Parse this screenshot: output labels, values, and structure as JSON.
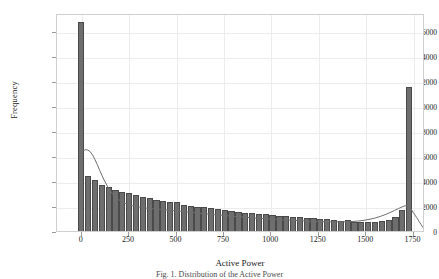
{
  "chart_data": {
    "type": "bar",
    "title": "",
    "xlabel": "Active Power",
    "ylabel": "Frequency",
    "xlim": [
      -130,
      1810
    ],
    "ylim": [
      0,
      17400
    ],
    "grid": true,
    "legend": null,
    "xticks": [
      0,
      250,
      500,
      750,
      1000,
      1250,
      1500,
      1750
    ],
    "yticks": [
      0,
      2000,
      4000,
      6000,
      8000,
      10000,
      12000,
      14000,
      16000
    ],
    "bar_color": "#6e6e6e",
    "bar_edge_color": "#4a4a4a",
    "kde_color": "#6e6e6e",
    "bin_width": 36,
    "x": [
      0,
      36,
      72,
      108,
      144,
      180,
      216,
      252,
      288,
      324,
      360,
      396,
      432,
      468,
      504,
      540,
      576,
      612,
      648,
      684,
      720,
      756,
      792,
      828,
      864,
      900,
      936,
      972,
      1008,
      1044,
      1080,
      1116,
      1152,
      1188,
      1224,
      1260,
      1296,
      1332,
      1368,
      1404,
      1440,
      1476,
      1512,
      1548,
      1584,
      1620,
      1656,
      1692,
      1728
    ],
    "values": [
      16700,
      4400,
      4050,
      3700,
      3500,
      3300,
      3150,
      3000,
      2850,
      2700,
      2600,
      2500,
      2400,
      2350,
      2280,
      2050,
      2000,
      1950,
      1880,
      1800,
      1720,
      1650,
      1580,
      1520,
      1470,
      1420,
      1370,
      1320,
      1280,
      1230,
      1180,
      1140,
      1100,
      1060,
      1020,
      980,
      940,
      900,
      820,
      860,
      700,
      750,
      700,
      720,
      780,
      900,
      1150,
      1700,
      11500
    ],
    "kde": {
      "peak_left": 6700,
      "peak_right": 2250,
      "x": [
        0,
        20,
        45,
        70,
        95,
        120,
        150,
        180,
        215,
        250,
        290,
        330,
        370,
        420,
        470,
        520,
        580,
        640,
        700,
        780,
        860,
        940,
        1020,
        1100,
        1180,
        1260,
        1340,
        1420,
        1490,
        1550,
        1600,
        1650,
        1690,
        1720,
        1750,
        1780,
        1800
      ],
      "y": [
        6450,
        6700,
        6550,
        5900,
        5000,
        4150,
        3350,
        2800,
        2450,
        2250,
        2100,
        2000,
        1950,
        1880,
        1800,
        1730,
        1640,
        1550,
        1470,
        1360,
        1260,
        1170,
        1090,
        1020,
        960,
        910,
        880,
        900,
        1000,
        1200,
        1450,
        1800,
        2100,
        2250,
        1600,
        900,
        420
      ]
    }
  },
  "caption": {
    "text": "Fig. 1.  Distribution of the Active Power"
  }
}
